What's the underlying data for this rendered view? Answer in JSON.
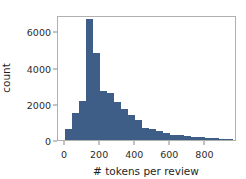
{
  "chart_data": {
    "type": "bar",
    "title": "",
    "xlabel": "# tokens per review",
    "ylabel": "count",
    "xlim": [
      -40,
      980
    ],
    "ylim": [
      0,
      6900
    ],
    "grid": false,
    "legend": null,
    "bin_width": 40,
    "bar_color": "#3f5e87",
    "xticks": [
      0,
      200,
      400,
      600,
      800
    ],
    "xtick_labels": [
      "0",
      "200",
      "400",
      "600",
      "800"
    ],
    "yticks": [
      0,
      2000,
      4000,
      6000
    ],
    "ytick_labels": [
      "0",
      "2000",
      "4000",
      "6000"
    ],
    "bin_starts": [
      0,
      40,
      80,
      120,
      160,
      200,
      240,
      280,
      320,
      360,
      400,
      440,
      480,
      520,
      560,
      600,
      640,
      680,
      720,
      760,
      800,
      840,
      880,
      920
    ],
    "values": [
      600,
      1500,
      2150,
      6700,
      4800,
      2700,
      2600,
      2100,
      1700,
      1400,
      1100,
      650,
      600,
      480,
      400,
      300,
      250,
      200,
      170,
      150,
      120,
      100,
      80,
      60
    ]
  }
}
